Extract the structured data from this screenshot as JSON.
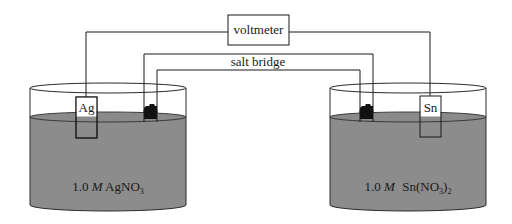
{
  "diagram": {
    "type": "galvanic-cell",
    "voltmeter": {
      "label": "voltmeter"
    },
    "salt_bridge": {
      "label": "salt bridge"
    },
    "left_cell": {
      "electrode": "Ag",
      "solution": {
        "concentration": "1.0",
        "unit": "M",
        "formula_main": "AgNO",
        "formula_sub": "3",
        "formula_tail": ""
      }
    },
    "right_cell": {
      "electrode": "Sn",
      "solution": {
        "concentration": "1.0",
        "unit": "M",
        "formula_main": "Sn(NO",
        "formula_sub": "3",
        "formula_paren": ")",
        "formula_sub2": "2"
      }
    },
    "colors": {
      "solution": "#8c8c8c",
      "line": "#1a1a1a",
      "background": "#ffffff",
      "plug": "#111111"
    }
  }
}
